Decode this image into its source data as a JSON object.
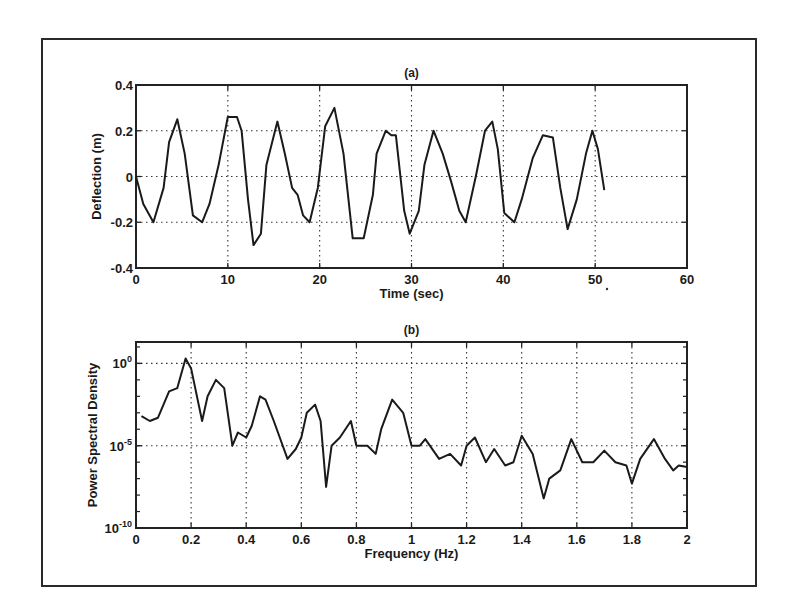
{
  "chart_data": [
    {
      "id": "a",
      "type": "line",
      "title": "(a)",
      "xlabel": "Time (sec)",
      "ylabel": "Deflection (m)",
      "xlim": [
        0,
        60
      ],
      "ylim": [
        -0.4,
        0.4
      ],
      "xticks": [
        0,
        10,
        20,
        30,
        40,
        50,
        60
      ],
      "xtick_labels": [
        "0",
        "10",
        "20",
        "30",
        "40",
        "50",
        "60"
      ],
      "yticks": [
        0.4,
        0.2,
        0,
        -0.2,
        -0.4
      ],
      "ytick_labels": [
        "0.4",
        "0.2",
        "0",
        "-0.2",
        "-0.4"
      ],
      "grid": true,
      "yscale": "linear",
      "series": [
        {
          "name": "deflection",
          "x": [
            0,
            0.8,
            1.9,
            3,
            3.6,
            4.5,
            5.3,
            6.2,
            7.2,
            8,
            9,
            10,
            11,
            11.5,
            12.2,
            12.8,
            13.6,
            14.2,
            15.4,
            16.2,
            17,
            17.6,
            18.2,
            18.9,
            19.8,
            20.6,
            21.6,
            22.6,
            23.6,
            24.8,
            25.8,
            26.2,
            27.2,
            27.8,
            28.3,
            29.2,
            29.8,
            30.8,
            31.4,
            32.4,
            33.4,
            34.3,
            35.2,
            35.9,
            37,
            38,
            38.8,
            39.4,
            40.1,
            41.2,
            42,
            43.2,
            44.3,
            45.4,
            46.2,
            47,
            48,
            49,
            49.7,
            50.3,
            51
          ],
          "y": [
            0,
            -0.12,
            -0.2,
            -0.05,
            0.15,
            0.25,
            0.1,
            -0.17,
            -0.2,
            -0.12,
            0.05,
            0.26,
            0.26,
            0.2,
            -0.1,
            -0.3,
            -0.25,
            0.05,
            0.24,
            0.1,
            -0.05,
            -0.08,
            -0.17,
            -0.2,
            -0.05,
            0.22,
            0.3,
            0.1,
            -0.27,
            -0.27,
            -0.08,
            0.1,
            0.2,
            0.18,
            0.18,
            -0.15,
            -0.25,
            -0.15,
            0.05,
            0.2,
            0.1,
            -0.02,
            -0.15,
            -0.2,
            0,
            0.2,
            0.24,
            0.12,
            -0.16,
            -0.2,
            -0.1,
            0.08,
            0.18,
            0.17,
            -0.05,
            -0.23,
            -0.1,
            0.1,
            0.2,
            0.12,
            -0.06
          ]
        }
      ]
    },
    {
      "id": "b",
      "type": "line",
      "title": "(b)",
      "xlabel": "Frequency (Hz)",
      "ylabel": "Power Spectral Density",
      "xlim": [
        0,
        2
      ],
      "ylim": [
        1e-10,
        20
      ],
      "yscale": "log",
      "xticks": [
        0,
        0.2,
        0.4,
        0.6,
        0.8,
        1,
        1.2,
        1.4,
        1.6,
        1.8,
        2
      ],
      "xtick_labels": [
        "0",
        "0.2",
        "0.4",
        "0.6",
        "0.8",
        "1",
        "1.2",
        "1.4",
        "1.6",
        "1.8",
        "2"
      ],
      "yticks_log10": [
        0,
        -5,
        -10
      ],
      "ytick_labels": [
        "10^0",
        "10^-5",
        "10^-10"
      ],
      "grid": true,
      "series": [
        {
          "name": "psd",
          "x": [
            0.02,
            0.05,
            0.08,
            0.12,
            0.15,
            0.18,
            0.2,
            0.24,
            0.26,
            0.29,
            0.32,
            0.35,
            0.37,
            0.4,
            0.42,
            0.45,
            0.47,
            0.5,
            0.55,
            0.58,
            0.6,
            0.62,
            0.65,
            0.67,
            0.69,
            0.71,
            0.74,
            0.78,
            0.8,
            0.84,
            0.87,
            0.89,
            0.93,
            0.97,
            1.0,
            1.03,
            1.05,
            1.1,
            1.14,
            1.18,
            1.2,
            1.23,
            1.27,
            1.3,
            1.34,
            1.37,
            1.4,
            1.44,
            1.48,
            1.5,
            1.54,
            1.58,
            1.62,
            1.66,
            1.7,
            1.74,
            1.78,
            1.8,
            1.83,
            1.88,
            1.92,
            1.95,
            1.97,
            2.0
          ],
          "log10_y": [
            -3.2,
            -3.5,
            -3.3,
            -1.7,
            -1.5,
            0.3,
            -0.3,
            -3.5,
            -2,
            -1,
            -1.5,
            -5,
            -4.2,
            -4.5,
            -3.8,
            -2,
            -2.2,
            -3.5,
            -5.8,
            -5.2,
            -4.5,
            -3,
            -2.5,
            -3.5,
            -7.5,
            -5,
            -4.5,
            -3.5,
            -5,
            -5,
            -5.5,
            -4,
            -2.2,
            -3,
            -5,
            -5,
            -4.6,
            -5.8,
            -5.5,
            -6.2,
            -5,
            -4.5,
            -6,
            -5.2,
            -6.2,
            -6,
            -4.4,
            -5.5,
            -8.2,
            -7,
            -6.5,
            -4.6,
            -6,
            -6,
            -5.3,
            -6,
            -6.2,
            -7.3,
            -5.8,
            -4.6,
            -5.8,
            -6.5,
            -6.2,
            -6.3
          ]
        }
      ]
    }
  ]
}
